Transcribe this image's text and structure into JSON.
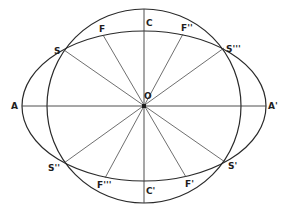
{
  "diagram": {
    "title": "",
    "center": {
      "x": 144,
      "y": 106
    },
    "circle": {
      "r": 97
    },
    "ellipse": {
      "rx": 122,
      "ry": 75
    },
    "colors": {
      "stroke": "#2a2a2a",
      "text": "#1e1e1e",
      "background": "#ffffff"
    },
    "labels": {
      "O": "O",
      "A": "A",
      "A_prime": "A'",
      "C": "C",
      "C_prime": "C'",
      "S": "S",
      "S_prime": "S'",
      "S_double": "S''",
      "S_triple": "S'''",
      "F": "F",
      "F_prime": "F'",
      "F_double": "F''",
      "F_triple": "F'''"
    },
    "points": {
      "A": {
        "x": 22,
        "y": 106
      },
      "A_prime": {
        "x": 266,
        "y": 106
      },
      "C": {
        "x": 144,
        "y": 9
      },
      "C_prime": {
        "x": 144,
        "y": 203
      },
      "S": {
        "x": 64,
        "y": 50
      },
      "S_prime": {
        "x": 225,
        "y": 162
      },
      "S_double": {
        "x": 64,
        "y": 163
      },
      "S_triple": {
        "x": 224,
        "y": 48
      },
      "F": {
        "x": 103,
        "y": 35
      },
      "F_prime": {
        "x": 186,
        "y": 177
      },
      "F_double": {
        "x": 183,
        "y": 34
      },
      "F_triple": {
        "x": 105,
        "y": 178
      }
    },
    "diameters": [
      [
        "A",
        "A_prime"
      ],
      [
        "C",
        "C_prime"
      ],
      [
        "S",
        "S_prime"
      ],
      [
        "S_triple",
        "S_double"
      ],
      [
        "F",
        "F_prime"
      ],
      [
        "F_double",
        "F_triple"
      ]
    ]
  }
}
